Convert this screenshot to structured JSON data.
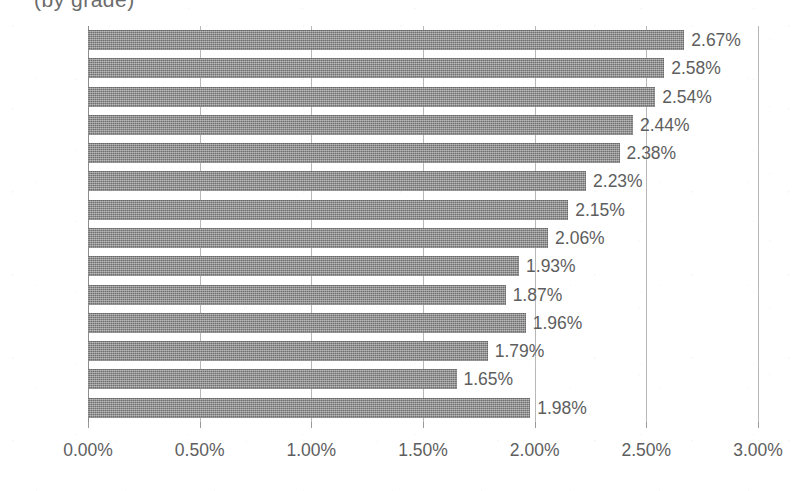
{
  "chart_data": {
    "type": "bar",
    "orientation": "horizontal",
    "title": "(by grade)",
    "title_truncated": true,
    "xlabel": "",
    "ylabel": "",
    "xlim": [
      0,
      3
    ],
    "xticks": [
      0,
      0.5,
      1,
      1.5,
      2,
      2.5,
      3
    ],
    "xtick_labels": [
      "0.00%",
      "0.50%",
      "1.00%",
      "1.50%",
      "2.00%",
      "2.50%",
      "3.00%"
    ],
    "grid": "vertical",
    "legend": "none",
    "value_suffix": "%",
    "categories": [
      "Pre-K",
      "K",
      "1st",
      "2nd",
      "3rd",
      "4th",
      "5th",
      "6th",
      "7th",
      "8th",
      "9th",
      "10th",
      "11th",
      "12th"
    ],
    "values": [
      2.67,
      2.58,
      2.54,
      2.44,
      2.38,
      2.23,
      2.15,
      2.06,
      1.93,
      1.87,
      1.96,
      1.79,
      1.65,
      1.98
    ],
    "data_labels": [
      "2.67%",
      "2.58%",
      "2.54%",
      "2.44%",
      "2.38%",
      "2.23%",
      "2.15%",
      "2.06%",
      "1.93%",
      "1.87%",
      "1.96%",
      "1.79%",
      "1.65%",
      "1.98%"
    ],
    "series": [
      {
        "name": "",
        "color": "#7d7d7d",
        "values": [
          2.67,
          2.58,
          2.54,
          2.44,
          2.38,
          2.23,
          2.15,
          2.06,
          1.93,
          1.87,
          1.96,
          1.79,
          1.65,
          1.98
        ]
      }
    ],
    "colors": {
      "bar_fill": "#7d7d7d",
      "gridline": "#b8b8b8",
      "axis": "#8d8d8d",
      "text": "#5e5e5e",
      "background": "#ffffff"
    }
  }
}
